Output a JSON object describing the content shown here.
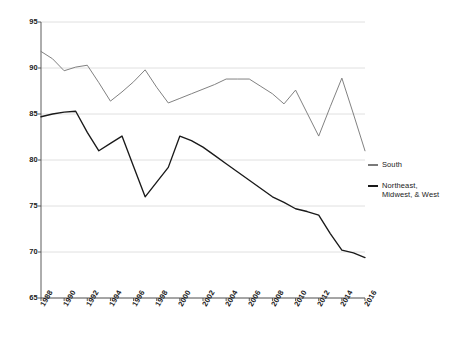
{
  "chart_data": {
    "type": "line",
    "title": "",
    "subtitle": "",
    "xlabel": "",
    "ylabel": "",
    "xlim": [
      1988,
      2016
    ],
    "ylim": [
      65,
      95
    ],
    "grid": true,
    "legend_position": "right",
    "y_ticks": [
      95,
      90,
      85,
      80,
      75,
      70,
      65
    ],
    "x_ticks": [
      1988,
      1990,
      1992,
      1994,
      1996,
      1998,
      2000,
      2002,
      2004,
      2006,
      2008,
      2010,
      2012,
      2014,
      2016
    ],
    "x": [
      1988,
      1989,
      1990,
      1991,
      1992,
      1993,
      1994,
      1995,
      1996,
      1997,
      1998,
      1999,
      2000,
      2001,
      2002,
      2003,
      2004,
      2005,
      2006,
      2007,
      2008,
      2009,
      2010,
      2011,
      2012,
      2013,
      2014,
      2015,
      2016
    ],
    "series": [
      {
        "name": "South",
        "color": "#7a7a7a",
        "values": [
          91.8,
          91.0,
          89.7,
          90.1,
          90.3,
          88.4,
          86.4,
          87.4,
          88.5,
          89.8,
          87.9,
          86.2,
          86.7,
          87.2,
          87.7,
          88.2,
          88.8,
          88.8,
          88.8,
          88.0,
          87.2,
          86.1,
          87.6,
          85.1,
          82.6,
          85.8,
          88.9,
          85.0,
          81.0
        ]
      },
      {
        "name": "Northeast, Midwest, & West",
        "color": "#1a1a1a",
        "values": [
          84.7,
          85.0,
          85.2,
          85.3,
          83.0,
          81.0,
          81.8,
          82.6,
          79.3,
          76.0,
          77.6,
          79.2,
          82.6,
          82.1,
          81.4,
          80.5,
          79.6,
          78.7,
          77.8,
          76.9,
          76.0,
          75.4,
          74.7,
          74.4,
          74.0,
          72.0,
          70.2,
          69.9,
          69.4
        ]
      }
    ]
  },
  "legend": {
    "entries": [
      {
        "label": "South"
      },
      {
        "label_line1": "Northeast,",
        "label_line2": "Midwest, & West"
      }
    ]
  },
  "axes": {
    "y_tick_labels": [
      "95",
      "90",
      "85",
      "80",
      "75",
      "70",
      "65"
    ],
    "x_tick_labels": [
      "1988",
      "1990",
      "1992",
      "1994",
      "1996",
      "1998",
      "2000",
      "2002",
      "2004",
      "2006",
      "2008",
      "2010",
      "2012",
      "2014",
      "2016"
    ]
  },
  "colors": {
    "south_line": "#7a7a7a",
    "other_line": "#1a1a1a",
    "grid": "#d8d8d8",
    "axis": "#4a4a4a",
    "background": "#ffffff"
  }
}
